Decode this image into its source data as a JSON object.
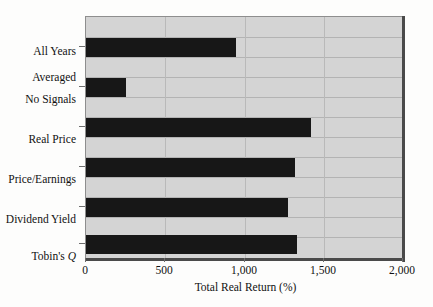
{
  "chart_data": {
    "type": "bar",
    "orientation": "horizontal",
    "title": "",
    "xlabel": "Total Real Return (%)",
    "ylabel": "",
    "xlim": [
      0,
      2000
    ],
    "xticks": [
      0,
      500,
      1000,
      1500,
      2000
    ],
    "xticklabels": [
      "0",
      "500",
      "1,000",
      "1,500",
      "2,000"
    ],
    "grid": "horizontal-and-vertical",
    "legend": "none",
    "categories": [
      "All Years\nAveraged",
      "No Signals",
      "Real Price",
      "Price/Earnings",
      "Dividend Yield",
      "Tobin's Q"
    ],
    "values": [
      945,
      250,
      1415,
      1315,
      1270,
      1325
    ],
    "bars": [
      {
        "label": "All Years Averaged",
        "label_line1": "All Years",
        "label_line2": "Averaged",
        "value": 945,
        "italic_suffix": ""
      },
      {
        "label": "No Signals",
        "label_line1": "No Signals",
        "label_line2": "",
        "value": 250,
        "italic_suffix": ""
      },
      {
        "label": "Real Price",
        "label_line1": "Real Price",
        "label_line2": "",
        "value": 1415,
        "italic_suffix": ""
      },
      {
        "label": "Price/Earnings",
        "label_line1": "Price/Earnings",
        "label_line2": "",
        "value": 1315,
        "italic_suffix": ""
      },
      {
        "label": "Dividend Yield",
        "label_line1": "Dividend Yield",
        "label_line2": "",
        "value": 1270,
        "italic_suffix": ""
      },
      {
        "label": "Tobin's Q",
        "label_line1": "Tobin's ",
        "label_line2": "",
        "value": 1325,
        "italic_suffix": "Q"
      }
    ],
    "colors": {
      "bar": "#171717",
      "plot_background": "#d4d4d4",
      "gridline": "#b3b3b3",
      "axis": "#4a4a4a",
      "text": "#111111",
      "page_background": "#fdfdfc"
    }
  }
}
